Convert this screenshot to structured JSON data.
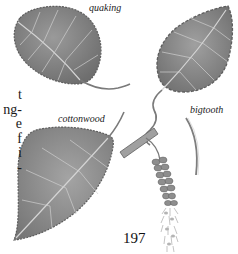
{
  "page": {
    "page_number": "197",
    "body_text_fragments": [
      "t",
      "ng-",
      "e",
      "f",
      "i",
      "-"
    ],
    "colors": {
      "leaf_fill": "#8a8a8a",
      "leaf_shadow": "#6f6f6f",
      "leaf_vein": "#d0d0d0",
      "catkin": "#9a9a9a",
      "text": "#1a1a1a"
    }
  },
  "illustrations": [
    {
      "id": "quaking",
      "label": "quaking"
    },
    {
      "id": "bigtooth",
      "label": "bigtooth"
    },
    {
      "id": "cottonwood",
      "label": "cottonwood"
    },
    {
      "id": "catkin",
      "label": ""
    }
  ]
}
